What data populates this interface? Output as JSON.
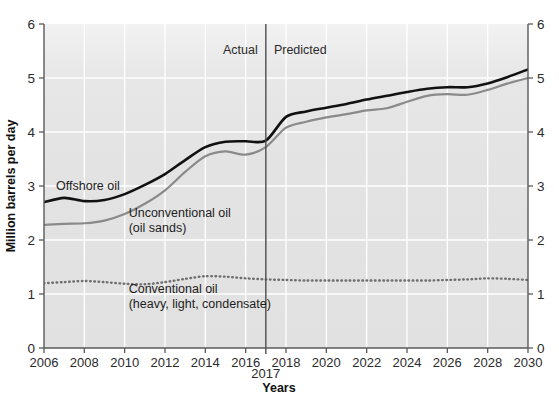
{
  "chart_data": {
    "type": "line",
    "title": "",
    "xlabel": "Years",
    "ylabel": "Million barrels per day",
    "xlim": [
      2006,
      2030
    ],
    "ylim": [
      0,
      6
    ],
    "grid": true,
    "legend_position": "inline-annotations",
    "x_ticks": [
      "2006",
      "2008",
      "2010",
      "2012",
      "2014",
      "2016",
      "2018",
      "2020",
      "2022",
      "2024",
      "2026",
      "2028",
      "2030"
    ],
    "x_tick_values": [
      2006,
      2008,
      2010,
      2012,
      2014,
      2016,
      2018,
      2020,
      2022,
      2024,
      2026,
      2028,
      2030
    ],
    "y_ticks": [
      "0",
      "1",
      "2",
      "3",
      "4",
      "5",
      "6"
    ],
    "y_tick_values": [
      0,
      1,
      2,
      3,
      4,
      5,
      6
    ],
    "y_ticks_right": [
      "0",
      "1",
      "2",
      "3",
      "4",
      "5",
      "6"
    ],
    "x": [
      2006,
      2007,
      2008,
      2009,
      2010,
      2011,
      2012,
      2013,
      2014,
      2015,
      2016,
      2017,
      2018,
      2019,
      2020,
      2021,
      2022,
      2023,
      2024,
      2025,
      2026,
      2027,
      2028,
      2029,
      2030
    ],
    "series": [
      {
        "name": "Offshore oil",
        "label": "Offshore oil",
        "style": "solid",
        "color": "#111111",
        "width": 2.6,
        "values": [
          2.7,
          2.78,
          2.72,
          2.74,
          2.85,
          3.02,
          3.22,
          3.48,
          3.72,
          3.82,
          3.83,
          3.84,
          4.28,
          4.38,
          4.45,
          4.52,
          4.6,
          4.67,
          4.74,
          4.8,
          4.83,
          4.83,
          4.9,
          5.02,
          5.16
        ]
      },
      {
        "name": "Unconventional oil (oil sands)",
        "label": "Unconventional oil",
        "label_line2": "(oil sands)",
        "style": "solid",
        "color": "#8a8a8a",
        "width": 2.2,
        "values": [
          2.28,
          2.3,
          2.31,
          2.36,
          2.48,
          2.67,
          2.92,
          3.26,
          3.55,
          3.64,
          3.58,
          3.72,
          4.08,
          4.19,
          4.27,
          4.33,
          4.4,
          4.44,
          4.56,
          4.67,
          4.7,
          4.69,
          4.78,
          4.9,
          5.0
        ]
      },
      {
        "name": "Conventional oil (heavy, light, condensate)",
        "label": "Conventional oil",
        "label_line2": "(heavy, light, condensate)",
        "style": "dotted",
        "color": "#6e6e6e",
        "width": 2.4,
        "values": [
          1.2,
          1.22,
          1.24,
          1.22,
          1.19,
          1.18,
          1.22,
          1.28,
          1.33,
          1.32,
          1.29,
          1.27,
          1.26,
          1.25,
          1.25,
          1.25,
          1.25,
          1.25,
          1.25,
          1.25,
          1.26,
          1.27,
          1.29,
          1.28,
          1.26
        ]
      }
    ],
    "annotations": [
      {
        "name": "actual-label",
        "text": "Actual",
        "x": 2016.6,
        "y": 5.45,
        "anchor": "end"
      },
      {
        "name": "predicted-label",
        "text": "Predicted",
        "x": 2017.4,
        "y": 5.45,
        "anchor": "start"
      },
      {
        "name": "divider-year-label",
        "text": "2017",
        "x": 2017,
        "y": -0.55,
        "anchor": "middle"
      }
    ],
    "divider": {
      "name": "actual-predicted-divider",
      "x": 2017,
      "color": "#4d4d4d",
      "width": 1.4
    },
    "colors": {
      "plot_background": "#e3e3e3",
      "plot_background_top": "#f1f1f1",
      "gridline": "#ffffff",
      "axis": "#5a5a5a",
      "page_background": "#ffffff",
      "text": "#2b2b2b"
    }
  }
}
